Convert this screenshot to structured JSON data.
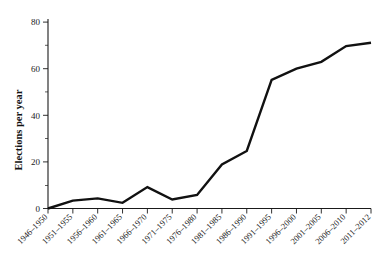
{
  "chart_data": {
    "type": "line",
    "title": "",
    "subtitle": "",
    "xlabel": "",
    "ylabel": "Elections per year",
    "categories": [
      "1946–1950",
      "1951–1955",
      "1956–1960",
      "1961–1965",
      "1966–1970",
      "1971–1975",
      "1976–1980",
      "1981–1985",
      "1986–1990",
      "1991–1995",
      "1996–2000",
      "2001–2005",
      "2006–2010",
      "2011–2012"
    ],
    "values": [
      0,
      3.5,
      4.5,
      2.5,
      9.5,
      4,
      6,
      19.5,
      25.5,
      57,
      62,
      65,
      72,
      73.5
    ],
    "series": [
      {
        "name": "Elections per year",
        "values": [
          0,
          3.5,
          4.5,
          2.5,
          9.5,
          4,
          6,
          19.5,
          25.5,
          57,
          62,
          65,
          72,
          73.5
        ]
      }
    ],
    "ylim": [
      0,
      84
    ],
    "xlim": [
      0,
      13
    ],
    "y_ticks": [
      0,
      20,
      40,
      60,
      80
    ],
    "y_tick_labels": [
      "0",
      "20",
      "40",
      "60",
      "80"
    ],
    "y_minor_ticks": [
      10,
      30,
      50,
      70
    ],
    "grid": false,
    "legend": false,
    "legend_position": "none",
    "line_color": "#111111",
    "background_color": "#ffffff",
    "x_tick_label_rotation": -45
  },
  "axes": {
    "y_axis_label": "Elections per year"
  }
}
